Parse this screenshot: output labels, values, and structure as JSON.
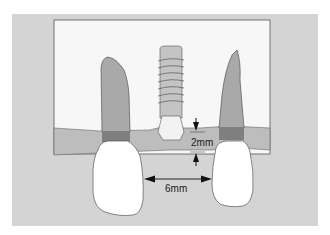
{
  "figure": {
    "labels": {
      "vertical_distance": "2mm",
      "horizontal_distance": "6mm"
    },
    "colors": {
      "background": "#d4d4d4",
      "bone": "#f7f7f7",
      "gingiva": "#bdbdbd",
      "root": "#a9a9a9",
      "cej_band": "#7f7f7f",
      "crown": "#ffffff",
      "implant": "#c4c4c4",
      "outline": "#555555"
    },
    "elements": [
      "bone-block",
      "gingiva-band",
      "left-tooth",
      "right-tooth",
      "implant",
      "vertical-dimension-2mm",
      "horizontal-dimension-6mm"
    ]
  }
}
